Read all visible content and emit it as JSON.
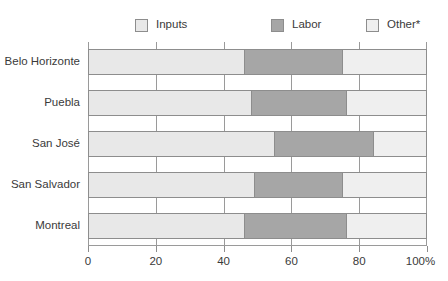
{
  "chart_data": {
    "type": "bar",
    "orientation": "horizontal",
    "stacked": true,
    "title": "",
    "subtitle": "",
    "xlabel": "",
    "ylabel": "",
    "xlim": [
      0,
      100
    ],
    "xticks": [
      0,
      20,
      40,
      60,
      80,
      100
    ],
    "xtick_labels": [
      "0",
      "20",
      "40",
      "60",
      "80",
      "100%"
    ],
    "grid": true,
    "grid_axis": "x",
    "legend_position": "top",
    "categories": [
      "Belo Horizonte",
      "Puebla",
      "San José",
      "San Salvador",
      "Montreal"
    ],
    "series": [
      {
        "name": "Inputs",
        "color": "#e8e8e8",
        "values": [
          46,
          48,
          55,
          49,
          46
        ]
      },
      {
        "name": "Labor",
        "color": "#a6a6a6",
        "values": [
          29,
          28,
          29,
          26,
          30
        ]
      },
      {
        "name": "Other*",
        "color": "#efefef",
        "values": [
          25,
          24,
          16,
          25,
          24
        ]
      }
    ]
  },
  "legend": {
    "items": [
      {
        "label": "Inputs",
        "color": "#e8e8e8"
      },
      {
        "label": "Labor",
        "color": "#a6a6a6"
      },
      {
        "label": "Other*",
        "color": "#efefef"
      }
    ]
  },
  "axis": {
    "x_tick_labels": [
      "0",
      "20",
      "40",
      "60",
      "80",
      "100%"
    ]
  },
  "categories": [
    "Belo Horizonte",
    "Puebla",
    "San José",
    "San Salvador",
    "Montreal"
  ],
  "colors": {
    "inputs": "#e8e8e8",
    "labor": "#a6a6a6",
    "other": "#efefef",
    "border": "#8d8d8d",
    "grid": "#9a9a9a",
    "text": "#3a3a3a"
  }
}
